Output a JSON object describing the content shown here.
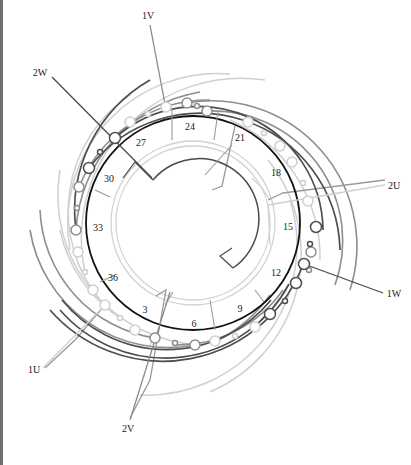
{
  "diagram": {
    "type": "three-phase stator winding diagram",
    "center": [
      193,
      223
    ],
    "slot_labels": [
      {
        "text": "24",
        "x": 190,
        "y": 130
      },
      {
        "text": "21",
        "x": 240,
        "y": 141
      },
      {
        "text": "18",
        "x": 276,
        "y": 176
      },
      {
        "text": "15",
        "x": 288,
        "y": 230
      },
      {
        "text": "12",
        "x": 276,
        "y": 276
      },
      {
        "text": "9",
        "x": 240,
        "y": 312
      },
      {
        "text": "6",
        "x": 194,
        "y": 327
      },
      {
        "text": "3",
        "x": 145,
        "y": 313
      },
      {
        "text": "36",
        "x": 113,
        "y": 281
      },
      {
        "text": "33",
        "x": 98,
        "y": 231
      },
      {
        "text": "30",
        "x": 109,
        "y": 182
      },
      {
        "text": "27",
        "x": 141,
        "y": 146
      }
    ],
    "terminals": [
      {
        "label": "1V",
        "x": 148,
        "y": 19
      },
      {
        "label": "2W",
        "x": 40,
        "y": 76
      },
      {
        "label": "2U",
        "x": 392,
        "y": 186
      },
      {
        "label": "1W",
        "x": 388,
        "y": 296
      },
      {
        "label": "1U",
        "x": 29,
        "y": 373
      },
      {
        "label": "2V",
        "x": 122,
        "y": 428
      }
    ],
    "colors": {
      "phase_dark": "#4a4a4a",
      "phase_mid": "#8c8c8c",
      "phase_light": "#c8c8c8",
      "main_ring": "#111111",
      "label": "#222222"
    }
  }
}
